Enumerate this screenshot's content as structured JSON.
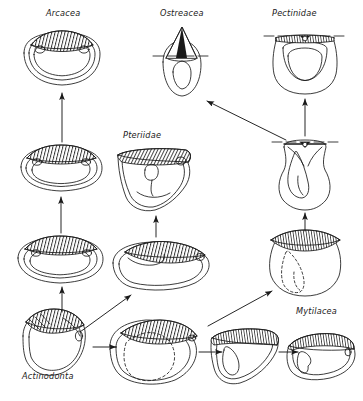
{
  "figure": {
    "name": "bivalve-evolution-diagram",
    "width": 363,
    "height": 401,
    "background": "#ffffff",
    "ink": "#1a1a1a"
  },
  "labels": {
    "arcacea": "Arcacea",
    "ostreacea": "Ostreacea",
    "pectinidae": "Pectinidae",
    "pteriidae": "Pteriidae",
    "mytilacea": "Mytilacea",
    "actinodonta": "Actinodonta"
  },
  "label_positions": {
    "arcacea": {
      "x": 46,
      "y": 8
    },
    "ostreacea": {
      "x": 160,
      "y": 8
    },
    "pectinidae": {
      "x": 272,
      "y": 8
    },
    "pteriidae": {
      "x": 123,
      "y": 130
    },
    "mytilacea": {
      "x": 296,
      "y": 306
    },
    "actinodonta": {
      "x": 22,
      "y": 371
    }
  },
  "specimens": [
    {
      "name": "arca-shell-top",
      "label": "Arcacea",
      "cx": 62,
      "cy": 62,
      "type": "arca-round"
    },
    {
      "name": "ostrea-shell-top",
      "label": "Ostreacea",
      "cx": 182,
      "cy": 68,
      "type": "oyster"
    },
    {
      "name": "pecten-shell-top",
      "label": "Pectinidae",
      "cx": 305,
      "cy": 62,
      "type": "pecten"
    },
    {
      "name": "arca-shell-mid",
      "label": "",
      "cx": 62,
      "cy": 167,
      "type": "arca-oval"
    },
    {
      "name": "pteria-shell",
      "label": "Pteriidae",
      "cx": 155,
      "cy": 178,
      "type": "pteria"
    },
    {
      "name": "pecten-ancestor-shell",
      "label": "",
      "cx": 305,
      "cy": 172,
      "type": "pecten-narrow"
    },
    {
      "name": "arca-shell-lower",
      "label": "",
      "cx": 62,
      "cy": 258,
      "type": "arca-oval"
    },
    {
      "name": "mytilid-shell-mid",
      "label": "",
      "cx": 158,
      "cy": 262,
      "type": "mussel-round"
    },
    {
      "name": "pecten-base-shell",
      "label": "",
      "cx": 305,
      "cy": 262,
      "type": "pecten-dashed"
    },
    {
      "name": "actinodonta-shell",
      "label": "Actinodonta",
      "cx": 56,
      "cy": 342,
      "type": "actinodonta"
    },
    {
      "name": "mytilid-shell-a",
      "label": "",
      "cx": 155,
      "cy": 350,
      "type": "mussel-oval-dashed"
    },
    {
      "name": "mytilid-shell-b",
      "label": "",
      "cx": 245,
      "cy": 352,
      "type": "mussel-wedge"
    },
    {
      "name": "mytilacea-shell",
      "label": "Mytilacea",
      "cx": 320,
      "cy": 355,
      "type": "mytilus"
    }
  ],
  "arrows": [
    {
      "name": "arrow-actinodonta-to-arca-lower",
      "from": [
        62,
        318
      ],
      "to": [
        62,
        282
      ],
      "style": "straight-vertical"
    },
    {
      "name": "arrow-arca-lower-to-arca-mid",
      "from": [
        62,
        233
      ],
      "to": [
        62,
        196
      ],
      "style": "straight-vertical"
    },
    {
      "name": "arrow-arca-mid-to-arca-top",
      "from": [
        62,
        140
      ],
      "to": [
        62,
        100
      ],
      "style": "straight-vertical"
    },
    {
      "name": "arrow-actinodonta-to-mytilid",
      "from": [
        78,
        330
      ],
      "to": [
        132,
        293
      ],
      "style": "diagonal"
    },
    {
      "name": "arrow-mytilid-to-pteria",
      "from": [
        158,
        235
      ],
      "to": [
        158,
        214
      ],
      "style": "straight-vertical"
    },
    {
      "name": "arrow-mytilidA-to-pecten-base",
      "from": [
        205,
        325
      ],
      "to": [
        272,
        288
      ],
      "style": "diagonal"
    },
    {
      "name": "arrow-pecten-base-to-ancestor",
      "from": [
        305,
        234
      ],
      "to": [
        305,
        205
      ],
      "style": "straight-vertical"
    },
    {
      "name": "arrow-ancestor-to-pecten-top",
      "from": [
        305,
        138
      ],
      "to": [
        305,
        100
      ],
      "style": "straight-vertical"
    },
    {
      "name": "arrow-ancestor-to-ostrea",
      "from": [
        284,
        140
      ],
      "to": [
        210,
        103
      ],
      "style": "diagonal"
    },
    {
      "name": "arrow-actinodonta-to-mytilidA",
      "from": [
        95,
        347
      ],
      "to": [
        118,
        347
      ],
      "style": "straight-horizontal"
    },
    {
      "name": "arrow-mytilidA-to-mytilidB",
      "from": [
        196,
        352
      ],
      "to": [
        219,
        352
      ],
      "style": "straight-horizontal"
    },
    {
      "name": "arrow-mytilidB-to-mytilacea",
      "from": [
        277,
        352
      ],
      "to": [
        296,
        352
      ],
      "style": "straight-horizontal"
    }
  ]
}
